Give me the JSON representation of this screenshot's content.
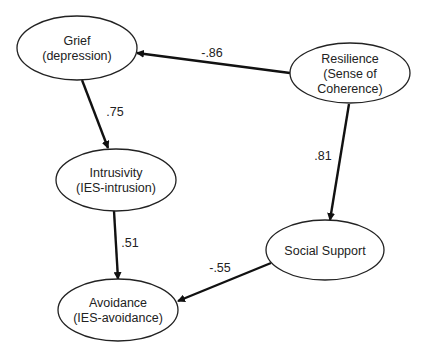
{
  "diagram": {
    "type": "path-model",
    "nodes": [
      {
        "id": "grief",
        "lines": [
          "Grief",
          "(depression)"
        ],
        "cx": 77,
        "cy": 48,
        "rx": 60,
        "ry": 32
      },
      {
        "id": "resilience",
        "lines": [
          "Resilience",
          "(Sense of",
          "Coherence)"
        ],
        "cx": 350,
        "cy": 73,
        "rx": 60,
        "ry": 30
      },
      {
        "id": "intrusivity",
        "lines": [
          "Intrusivity",
          "(IES-intrusion)"
        ],
        "cx": 116,
        "cy": 180,
        "rx": 60,
        "ry": 31
      },
      {
        "id": "social_support",
        "lines": [
          "Social Support"
        ],
        "cx": 325,
        "cy": 250,
        "rx": 59,
        "ry": 30
      },
      {
        "id": "avoidance",
        "lines": [
          "Avoidance",
          "(IES-avoidance)"
        ],
        "cx": 118,
        "cy": 310,
        "rx": 60,
        "ry": 31
      }
    ],
    "edges": [
      {
        "id": "resilience_to_grief",
        "from": "resilience",
        "to": "grief",
        "label": "-.86",
        "x1": 290,
        "y1": 73,
        "x2": 137,
        "y2": 53,
        "lx": 212,
        "ly": 57
      },
      {
        "id": "grief_to_intrusivity",
        "from": "grief",
        "to": "intrusivity",
        "label": ".75",
        "x1": 82,
        "y1": 80,
        "x2": 108,
        "y2": 148,
        "lx": 115,
        "ly": 116
      },
      {
        "id": "resilience_to_social_support",
        "from": "resilience",
        "to": "social_support",
        "label": ".81",
        "x1": 349,
        "y1": 104,
        "x2": 330,
        "y2": 220,
        "lx": 323,
        "ly": 160
      },
      {
        "id": "intrusivity_to_avoidance",
        "from": "intrusivity",
        "to": "avoidance",
        "label": ".51",
        "x1": 114,
        "y1": 211,
        "x2": 118,
        "y2": 279,
        "lx": 130,
        "ly": 247
      },
      {
        "id": "social_support_to_avoidance",
        "from": "social_support",
        "to": "avoidance",
        "label": "-.55",
        "x1": 271,
        "y1": 263,
        "x2": 178,
        "y2": 301,
        "lx": 220,
        "ly": 272
      }
    ],
    "colors": {
      "stroke": "#222222",
      "arrow": "#111111",
      "background": "#ffffff"
    }
  }
}
